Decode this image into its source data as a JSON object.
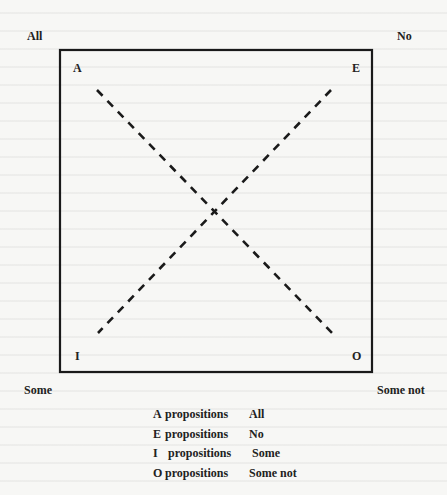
{
  "diagram": {
    "type": "square of opposition",
    "corner_outer_labels": {
      "top_left": "All",
      "top_right": "No",
      "bottom_left": "Some",
      "bottom_right": "Some not"
    },
    "corner_inner_labels": {
      "top_left": "A",
      "top_right": "E",
      "bottom_left": "I",
      "bottom_right": "O"
    },
    "box": {
      "x": 60,
      "y": 50,
      "width": 312,
      "height": 322,
      "stroke": "#1a1a1a"
    },
    "diagonals": [
      {
        "from": "A",
        "to": "O",
        "x1": 97,
        "y1": 90,
        "x2": 332,
        "y2": 333,
        "style": "dashed"
      },
      {
        "from": "E",
        "to": "I",
        "x1": 331,
        "y1": 90,
        "x2": 98,
        "y2": 333,
        "style": "dashed"
      }
    ]
  },
  "legend": {
    "items": [
      {
        "letter": "A",
        "word": "propositions",
        "meaning": "All"
      },
      {
        "letter": "E",
        "word": "propositions",
        "meaning": "No"
      },
      {
        "letter": "I",
        "word": "propositions",
        "meaning": "Some"
      },
      {
        "letter": "O",
        "word": "propositions",
        "meaning": "Some not"
      }
    ]
  }
}
